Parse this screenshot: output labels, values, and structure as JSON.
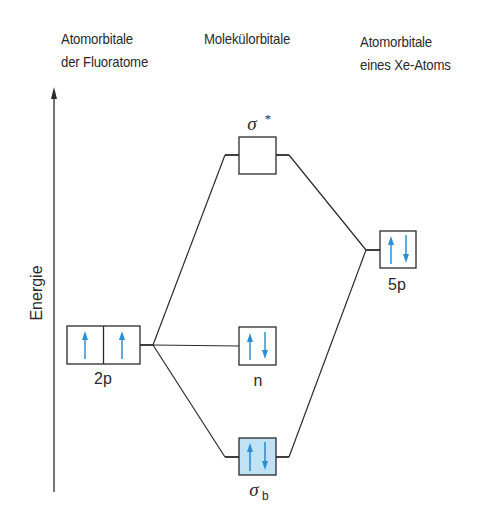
{
  "headers": {
    "left": {
      "line1": "Atomorbitale",
      "line2": "der Fluoratome"
    },
    "center": {
      "line1": "Molekülorbitale"
    },
    "right": {
      "line1": "Atomorbitale",
      "line2": "eines Xe-Atoms"
    }
  },
  "axis": {
    "label": "Energie"
  },
  "orbitals": {
    "f_2p": {
      "label": "2p",
      "electrons": [
        "up",
        "up"
      ]
    },
    "sigma_star": {
      "label": "σ",
      "superscript": "*",
      "electrons": []
    },
    "n": {
      "label": "n",
      "electrons": [
        "up",
        "down"
      ]
    },
    "sigma_b": {
      "label": "σ",
      "subscript": "b",
      "electrons": [
        "up",
        "down"
      ],
      "fill": "#bfe3f5"
    },
    "xe_5p": {
      "label": "5p",
      "electrons": [
        "up",
        "down"
      ]
    }
  },
  "colors": {
    "electron_arrow": "#2b8fd6",
    "line": "#2a2a2a",
    "bonding_fill": "#bfe3f5"
  }
}
